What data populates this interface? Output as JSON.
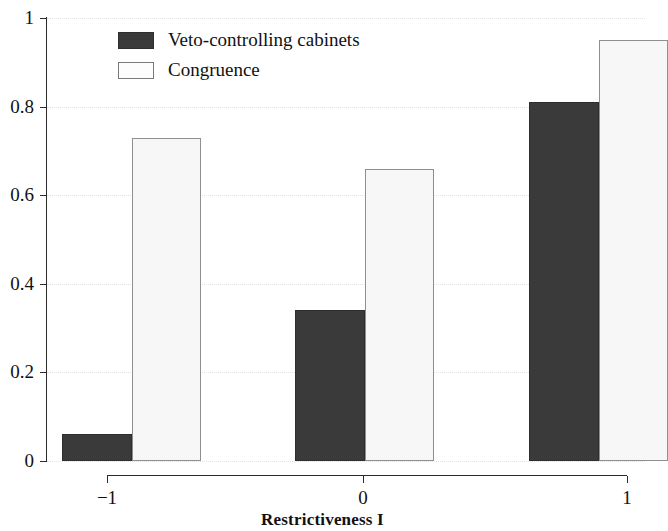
{
  "chart_data": {
    "type": "bar",
    "title": "",
    "xlabel": "Restrictiveness I",
    "ylabel": "",
    "categories": [
      "−1",
      "0",
      "1"
    ],
    "series": [
      {
        "name": "Veto-controlling cabinets",
        "values": [
          0.06,
          0.34,
          0.81
        ],
        "color": "#3a3a3a"
      },
      {
        "name": "Congruence",
        "values": [
          0.73,
          0.66,
          0.95
        ],
        "color": "#f7f7f7"
      }
    ],
    "ylim": [
      0,
      1
    ],
    "yticks": [
      "0",
      "0.2",
      "0.4",
      "0.6",
      "0.8",
      "1"
    ],
    "ytick_values": [
      0,
      0.2,
      0.4,
      0.6,
      0.8,
      1
    ],
    "xticks": [
      "−1",
      "0",
      "1"
    ],
    "grid": "horizontal-dotted",
    "legend_position": "top-left-inside"
  },
  "axes": {
    "x_title": "Restrictiveness I"
  },
  "legend": {
    "entries": [
      {
        "label": "Veto-controlling cabinets",
        "swatch": "dark"
      },
      {
        "label": "Congruence",
        "swatch": "light"
      }
    ]
  }
}
